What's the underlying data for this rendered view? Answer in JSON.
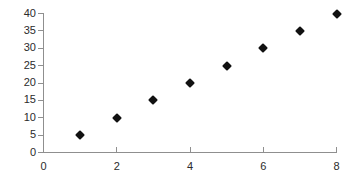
{
  "chart_data": {
    "type": "scatter",
    "title": "",
    "subtitle": "",
    "xlabel": "",
    "ylabel": "",
    "xlim": [
      0,
      8
    ],
    "ylim": [
      0,
      40
    ],
    "grid": false,
    "legend": false,
    "legend_position": "none",
    "marker": "diamond",
    "marker_color": "#111111",
    "axis_color": "#8f8f8f",
    "background_color": "#ffffff",
    "x_ticks": [
      0,
      2,
      4,
      6,
      8
    ],
    "x_tick_labels": [
      "0",
      "2",
      "4",
      "6",
      "8"
    ],
    "y_ticks": [
      0,
      5,
      10,
      15,
      20,
      25,
      30,
      35,
      40
    ],
    "y_tick_labels": [
      "0",
      "5",
      "10",
      "15",
      "20",
      "25",
      "30",
      "35",
      "40"
    ],
    "points": [
      {
        "x": 1,
        "y": 5
      },
      {
        "x": 2,
        "y": 10
      },
      {
        "x": 3,
        "y": 15
      },
      {
        "x": 4,
        "y": 20
      },
      {
        "x": 5,
        "y": 25
      },
      {
        "x": 6,
        "y": 30
      },
      {
        "x": 7,
        "y": 35
      },
      {
        "x": 8,
        "y": 40
      }
    ],
    "series": [
      {
        "name": "",
        "x": [
          1,
          2,
          3,
          4,
          5,
          6,
          7,
          8
        ],
        "values": [
          5,
          10,
          15,
          20,
          25,
          30,
          35,
          40
        ]
      }
    ]
  }
}
